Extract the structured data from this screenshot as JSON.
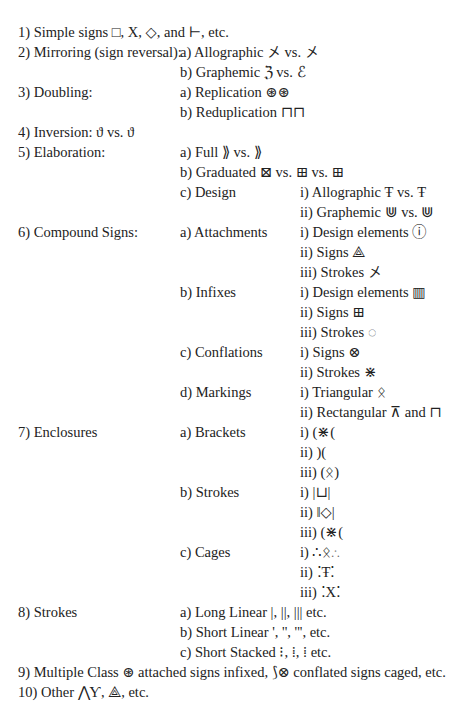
{
  "rows": [
    {
      "y": 32,
      "c1": "1) Simple signs □, Χ, ◇, and ⊢, etc.",
      "c2": "",
      "c3": ""
    },
    {
      "y": 52,
      "c1": "2) Mirroring (sign reversal):",
      "c2": "a) Allographic 㐅 vs. 㐅",
      "c3": ""
    },
    {
      "y": 72,
      "c1": "",
      "c2": "b) Graphemic ℨ vs. ℰ",
      "c3": ""
    },
    {
      "y": 92,
      "c1": "3) Doubling:",
      "c2": "a) Replication ⊛⊛",
      "c3": ""
    },
    {
      "y": 112,
      "c1": "",
      "c2": "b) Reduplication ⊓⊓",
      "c3": ""
    },
    {
      "y": 132,
      "c1": "4) Inversion: ϑ vs. ϑ",
      "c2": "",
      "c3": ""
    },
    {
      "y": 152,
      "c1": "5) Elaboration:",
      "c2": "a) Full ⟫ vs. ⟫",
      "c3": ""
    },
    {
      "y": 172,
      "c1": "",
      "c2": "b) Graduated ⊠ vs. ⊞ vs. ⊞",
      "c3": ""
    },
    {
      "y": 192,
      "c1": "",
      "c2": "c) Design",
      "c3": "i) Allographic Ŧ vs. Ŧ"
    },
    {
      "y": 212,
      "c1": "",
      "c2": "",
      "c3": "ii) Graphemic ⋓ vs. ⋓"
    },
    {
      "y": 232,
      "c1": "6) Compound Signs:",
      "c2": "a) Attachments",
      "c3": "i) Design elements ⓘ"
    },
    {
      "y": 252,
      "c1": "",
      "c2": "",
      "c3": "ii) Signs ⟁"
    },
    {
      "y": 272,
      "c1": "",
      "c2": "",
      "c3": "iii) Strokes 㐅"
    },
    {
      "y": 292,
      "c1": "",
      "c2": "b) Infixes",
      "c3": "i) Design elements ▥"
    },
    {
      "y": 312,
      "c1": "",
      "c2": "",
      "c3": "ii) Signs ⊞"
    },
    {
      "y": 332,
      "c1": "",
      "c2": "",
      "c3": "iii) Strokes ◌"
    },
    {
      "y": 352,
      "c1": "",
      "c2": "c) Conflations",
      "c3": "i) Signs ⊗"
    },
    {
      "y": 372,
      "c1": "",
      "c2": "",
      "c3": "ii) Strokes ⋇"
    },
    {
      "y": 392,
      "c1": "",
      "c2": "d) Markings",
      "c3": "i) Triangular ᛟ"
    },
    {
      "y": 412,
      "c1": "",
      "c2": "",
      "c3": "ii) Rectangular ⊼ and ⊓"
    },
    {
      "y": 432,
      "c1": "7) Enclosures",
      "c2": "a) Brackets",
      "c3": "i) (⋇("
    },
    {
      "y": 452,
      "c1": "",
      "c2": "",
      "c3": "ii) )("
    },
    {
      "y": 472,
      "c1": "",
      "c2": "",
      "c3": "iii) (ᛟ)"
    },
    {
      "y": 492,
      "c1": "",
      "c2": "b) Strokes",
      "c3": "i) |⊔|"
    },
    {
      "y": 512,
      "c1": "",
      "c2": "",
      "c3": "ii) ‖◇|"
    },
    {
      "y": 532,
      "c1": "",
      "c2": "",
      "c3": "iii) (⋇("
    },
    {
      "y": 552,
      "c1": "",
      "c2": "c) Cages",
      "c3": "i) ∴ᛟ∴"
    },
    {
      "y": 572,
      "c1": "",
      "c2": "",
      "c3": "ii) ⁚Ŧ⁚"
    },
    {
      "y": 592,
      "c1": "",
      "c2": "",
      "c3": "iii) ⁚Χ⁚"
    },
    {
      "y": 612,
      "c1": "8) Strokes",
      "c2": "a) Long Linear |, ||, ||| etc.",
      "c3": ""
    },
    {
      "y": 632,
      "c1": "",
      "c2": "b) Short Linear ', '', ''', etc.",
      "c3": ""
    },
    {
      "y": 652,
      "c1": "",
      "c2": "c) Short Stacked ⁝, ⁞, ⁞ etc.",
      "c3": ""
    },
    {
      "y": 672,
      "c1": "9) Multiple Class ⊛ attached signs infixed, ⟆⊗ conflated signs caged, etc.",
      "c2": "",
      "c3": ""
    },
    {
      "y": 692,
      "c1": "10) Other ⋀Ƴ, ⟁, etc.",
      "c2": "",
      "c3": ""
    }
  ]
}
